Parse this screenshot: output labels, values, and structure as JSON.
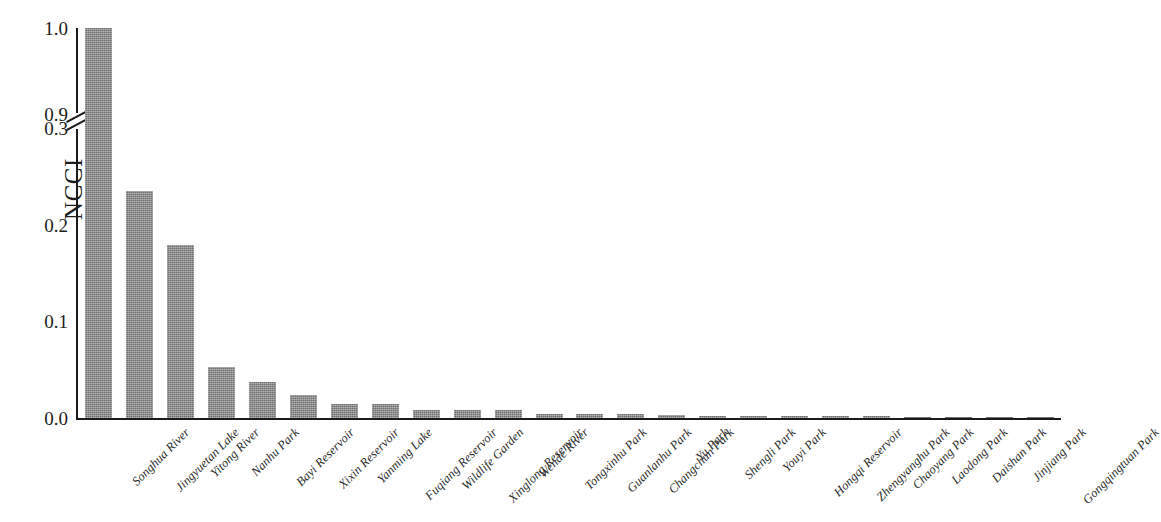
{
  "chart_data": {
    "type": "bar",
    "title": "",
    "xlabel": "",
    "ylabel": "NCCI",
    "grid": false,
    "legend": false,
    "axis_break": {
      "present": true,
      "lower_segment": [
        0.0,
        0.3
      ],
      "upper_segment": [
        0.9,
        1.0
      ],
      "description": "broken y-axis between 0.3 and 0.9"
    },
    "ytick_labels": [
      "1.0",
      "0.9",
      "0.3",
      "0.2",
      "0.1",
      "0.0"
    ],
    "ylim": [
      0.0,
      1.0
    ],
    "bar_color": "#8a8a8a",
    "categories": [
      "Songhua River",
      "Jingyuetan Lake",
      "Yitong River",
      "Nanhu Park",
      "Bayi Reservoir",
      "Xixin Reservoir",
      "Yanming Lake",
      "Fuqiang Reservoir",
      "Wildlife Garden",
      "Xinglong Reservoir",
      "Wende River",
      "Tongxinhu Park",
      "Guanlanhu Park",
      "Changchun Park",
      "Yu Park",
      "Shengli Park",
      "Youyi Park",
      "Hongqi Reservoir",
      "Zhengyanghu Park",
      "Chaoyang Park",
      "Laodong Park",
      "Daishan Park",
      "Jinjiang Park",
      "Gongqingtuan Park"
    ],
    "values": [
      1.0,
      0.235,
      0.179,
      0.053,
      0.037,
      0.024,
      0.015,
      0.014,
      0.008,
      0.008,
      0.008,
      0.004,
      0.004,
      0.004,
      0.003,
      0.002,
      0.002,
      0.002,
      0.002,
      0.002,
      0.001,
      0.001,
      0.001,
      0.001
    ]
  }
}
